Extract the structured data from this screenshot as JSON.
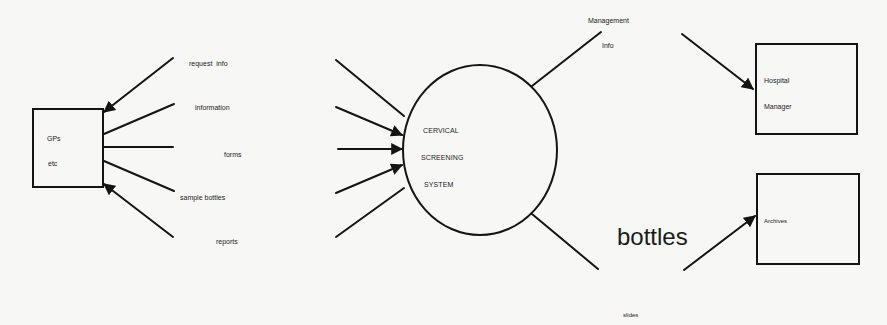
{
  "diagram": {
    "type": "context-diagram",
    "central_process": {
      "lines": [
        "CERVICAL",
        "SCREENING",
        "SYSTEM"
      ]
    },
    "entities": {
      "gps": {
        "lines": [
          "GPs",
          "etc"
        ]
      },
      "hospital_manager": {
        "lines": [
          "Hospital",
          "Manager"
        ]
      },
      "archives": {
        "lines": [
          "Archives"
        ]
      }
    },
    "flows": {
      "request_info": "request  info",
      "information": "information",
      "forms": "forms",
      "sample_bottles": "sample bottles",
      "reports": "reports",
      "management_info": [
        "Management",
        "Info"
      ],
      "bottles": "bottles",
      "slides": "slides"
    },
    "colors": {
      "ink": "#141414",
      "paper": "#f7f7f6"
    }
  }
}
